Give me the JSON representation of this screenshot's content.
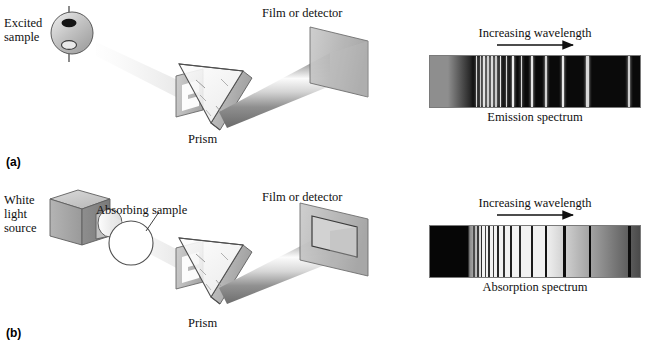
{
  "figure": {
    "title_visible": false,
    "panels": [
      {
        "tag": "(a)",
        "tag_x": 6,
        "tag_y": 155,
        "type": "emission",
        "source_label": "Excited\nsample",
        "source_label_x": 4,
        "source_label_y": 16,
        "slit_label": "",
        "prism_label": "Prism",
        "prism_label_x": 188,
        "prism_label_y": 132,
        "detector_label": "Film or detector",
        "detector_label_x": 262,
        "detector_label_y": 6
      },
      {
        "tag": "(b)",
        "tag_x": 6,
        "tag_y": 326,
        "type": "absorption",
        "source_label": "White\nlight\nsource",
        "source_label_x": 4,
        "source_label_y": 193,
        "sample_label": "Absorbing sample",
        "sample_label_x": 96,
        "sample_label_y": 203,
        "prism_label": "Prism",
        "prism_label_x": 188,
        "prism_label_y": 316,
        "detector_label": "Film or detector",
        "detector_label_x": 262,
        "detector_label_y": 190
      }
    ]
  },
  "spectra": [
    {
      "id": "emission",
      "caption": "Emission spectrum",
      "axis_label": "Increasing wavelength",
      "axis_direction": "right",
      "x": 429,
      "y": 55,
      "width": 212,
      "height": 53,
      "background": "#0a0a0a",
      "continuum_note": "dark background with bright emission lines",
      "left_glow": {
        "from": "#8e8e8e",
        "to": "#2a2a2a",
        "width_pct": 19
      },
      "lines": [
        {
          "pos_pct": 22.2,
          "width_px": 1.4,
          "brightness": "#d8d8d8"
        },
        {
          "pos_pct": 24.0,
          "width_px": 1.4,
          "brightness": "#cfcfcf"
        },
        {
          "pos_pct": 25.8,
          "width_px": 1.6,
          "brightness": "#e2e2e2"
        },
        {
          "pos_pct": 27.6,
          "width_px": 1.4,
          "brightness": "#cdcdcd"
        },
        {
          "pos_pct": 29.4,
          "width_px": 1.6,
          "brightness": "#dcdcdc"
        },
        {
          "pos_pct": 31.4,
          "width_px": 1.4,
          "brightness": "#c9c9c9"
        },
        {
          "pos_pct": 33.6,
          "width_px": 1.8,
          "brightness": "#e8e8e8"
        },
        {
          "pos_pct": 36.4,
          "width_px": 1.6,
          "brightness": "#d4d4d4"
        },
        {
          "pos_pct": 39.6,
          "width_px": 2.0,
          "brightness": "#ededed"
        },
        {
          "pos_pct": 43.6,
          "width_px": 1.8,
          "brightness": "#dadada"
        },
        {
          "pos_pct": 48.6,
          "width_px": 2.0,
          "brightness": "#e6e6e6"
        },
        {
          "pos_pct": 55.0,
          "width_px": 2.0,
          "brightness": "#d2d2d2"
        },
        {
          "pos_pct": 63.2,
          "width_px": 2.2,
          "brightness": "#e9e9e9"
        },
        {
          "pos_pct": 75.0,
          "width_px": 2.2,
          "brightness": "#d8d8d8"
        },
        {
          "pos_pct": 94.6,
          "width_px": 2.0,
          "brightness": "#cfcfcf"
        }
      ],
      "caption_x": 429,
      "caption_y": 110,
      "axis_label_x": 429,
      "axis_label_y": 26,
      "arrow_x1": 495,
      "arrow_x2": 575,
      "arrow_y": 46
    },
    {
      "id": "absorption",
      "caption": "Absorption spectrum",
      "axis_label": "Increasing wavelength",
      "axis_direction": "right",
      "x": 429,
      "y": 225,
      "width": 212,
      "height": 53,
      "background": "#efefef",
      "continuum_note": "bright continuum with dark absorption lines; black at short wavelength end",
      "left_dark": {
        "color": "#060606",
        "width_pct": 19
      },
      "right_fade": {
        "from": "#f2f2f2",
        "to": "#4a4a4a",
        "start_pct": 55
      },
      "lines": [
        {
          "pos_pct": 21.0,
          "width_px": 1.4,
          "brightness": "#4a4a4a"
        },
        {
          "pos_pct": 22.8,
          "width_px": 1.4,
          "brightness": "#3a3a3a"
        },
        {
          "pos_pct": 24.6,
          "width_px": 1.6,
          "brightness": "#2d2d2d"
        },
        {
          "pos_pct": 26.4,
          "width_px": 1.4,
          "brightness": "#3f3f3f"
        },
        {
          "pos_pct": 28.2,
          "width_px": 1.6,
          "brightness": "#303030"
        },
        {
          "pos_pct": 30.2,
          "width_px": 1.4,
          "brightness": "#3a3a3a"
        },
        {
          "pos_pct": 32.4,
          "width_px": 1.8,
          "brightness": "#252525"
        },
        {
          "pos_pct": 35.2,
          "width_px": 1.6,
          "brightness": "#333333"
        },
        {
          "pos_pct": 38.6,
          "width_px": 2.0,
          "brightness": "#1e1e1e"
        },
        {
          "pos_pct": 43.0,
          "width_px": 1.8,
          "brightness": "#2a2a2a"
        },
        {
          "pos_pct": 48.4,
          "width_px": 2.0,
          "brightness": "#1c1c1c"
        },
        {
          "pos_pct": 55.4,
          "width_px": 2.2,
          "brightness": "#141414"
        },
        {
          "pos_pct": 64.0,
          "width_px": 2.4,
          "brightness": "#0d0d0d"
        },
        {
          "pos_pct": 76.2,
          "width_px": 2.4,
          "brightness": "#0a0a0a"
        },
        {
          "pos_pct": 95.0,
          "width_px": 2.2,
          "brightness": "#0d0d0d"
        }
      ],
      "caption_x": 429,
      "caption_y": 280,
      "axis_label_x": 429,
      "axis_label_y": 196,
      "arrow_x1": 495,
      "arrow_x2": 575,
      "arrow_y": 216
    }
  ],
  "colors": {
    "ink": "#111111",
    "outline": "#4a4a4a",
    "solid_gray": "#b9b9b9",
    "solid_gray_dark": "#8d8d8d",
    "solid_gray_light": "#d6d6d6",
    "beam_light": "#f4f4f4",
    "beam_shadow": "#6f6f6f",
    "page_bg": "#ffffff"
  }
}
